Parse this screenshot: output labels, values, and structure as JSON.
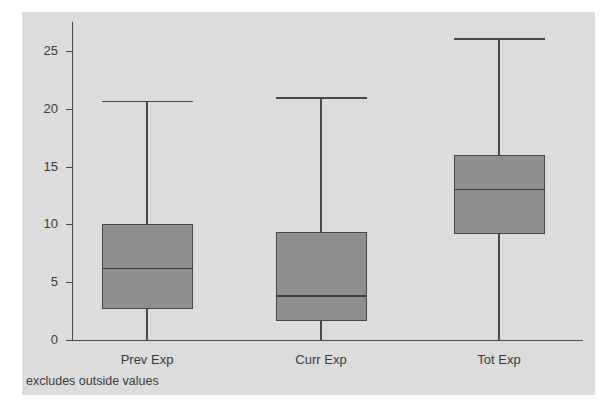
{
  "chart_data": {
    "type": "box",
    "title": "",
    "xlabel": "",
    "ylabel": "",
    "note": "excludes outside values",
    "ylim": [
      0,
      27.5
    ],
    "yticks": [
      0,
      5,
      10,
      15,
      20,
      25
    ],
    "grid": false,
    "legend": "none",
    "categories": [
      "Prev Exp",
      "Curr Exp",
      "Tot Exp"
    ],
    "boxes": [
      {
        "label": "Prev Exp",
        "whisker_low": 0,
        "q1": 2.7,
        "median": 6.2,
        "q3": 10.0,
        "whisker_high": 20.7
      },
      {
        "label": "Curr Exp",
        "whisker_low": 0,
        "q1": 1.6,
        "median": 3.8,
        "q3": 9.3,
        "whisker_high": 21.0
      },
      {
        "label": "Tot Exp",
        "whisker_low": 0,
        "q1": 9.2,
        "median": 13.0,
        "q3": 16.0,
        "whisker_high": 26.1
      }
    ],
    "colors": {
      "box_fill": "#8f8f8f",
      "box_border": "#454545",
      "axis": "#4a4a4a",
      "panel_background": "#dcdcdc",
      "page_background": "#ffffff",
      "text": "#3a3a3a"
    }
  },
  "axis": {
    "tick_labels": [
      "0",
      "5",
      "10",
      "15",
      "20",
      "25"
    ]
  }
}
